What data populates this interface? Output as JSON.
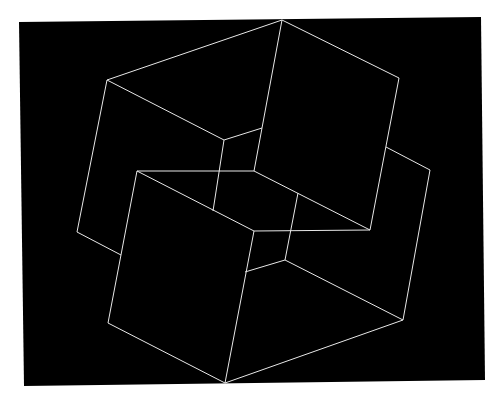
{
  "artwork": {
    "background": "#ffffff",
    "field_color": "#000000",
    "line_color": "#e8e8e8",
    "field": [
      [
        19,
        22
      ],
      [
        481,
        17
      ],
      [
        485,
        380
      ],
      [
        24,
        386
      ]
    ],
    "segments": [
      [
        [
          107,
          80
        ],
        [
          282,
          20
        ]
      ],
      [
        [
          282,
          20
        ],
        [
          399,
          78
        ]
      ],
      [
        [
          107,
          80
        ],
        [
          224,
          140
        ]
      ],
      [
        [
          224,
          140
        ],
        [
          262,
          128
        ]
      ],
      [
        [
          262,
          128
        ],
        [
          282,
          20
        ]
      ],
      [
        [
          399,
          78
        ],
        [
          370,
          230
        ]
      ],
      [
        [
          107,
          80
        ],
        [
          77,
          232
        ]
      ],
      [
        [
          77,
          232
        ],
        [
          121,
          255
        ]
      ],
      [
        [
          224,
          140
        ],
        [
          213,
          211
        ]
      ],
      [
        [
          262,
          128
        ],
        [
          254,
          171
        ]
      ],
      [
        [
          137,
          171
        ],
        [
          254,
          171
        ]
      ],
      [
        [
          254,
          171
        ],
        [
          370,
          230
        ]
      ],
      [
        [
          137,
          171
        ],
        [
          254,
          231
        ]
      ],
      [
        [
          254,
          231
        ],
        [
          370,
          230
        ]
      ],
      [
        [
          137,
          171
        ],
        [
          108,
          323
        ]
      ],
      [
        [
          108,
          323
        ],
        [
          225,
          383
        ]
      ],
      [
        [
          254,
          231
        ],
        [
          225,
          383
        ]
      ],
      [
        [
          386,
          147
        ],
        [
          430,
          170
        ]
      ],
      [
        [
          430,
          170
        ],
        [
          403,
          320
        ]
      ],
      [
        [
          403,
          320
        ],
        [
          225,
          383
        ]
      ],
      [
        [
          285,
          260
        ],
        [
          403,
          320
        ]
      ],
      [
        [
          245,
          272
        ],
        [
          285,
          260
        ]
      ],
      [
        [
          285,
          260
        ],
        [
          298,
          193
        ]
      ]
    ]
  }
}
